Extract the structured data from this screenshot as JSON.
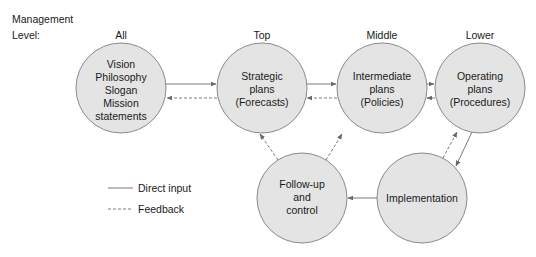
{
  "header": {
    "line1": "Management",
    "line2": "Level:"
  },
  "levels": [
    {
      "label": "All"
    },
    {
      "label": "Top"
    },
    {
      "label": "Middle"
    },
    {
      "label": "Lower"
    }
  ],
  "nodes": [
    {
      "id": "vision",
      "lines": [
        "Vision",
        "Philosophy",
        "Slogan",
        "Mission",
        "statements"
      ]
    },
    {
      "id": "strategic",
      "lines": [
        "Strategic",
        "plans",
        "(Forecasts)"
      ]
    },
    {
      "id": "intermediate",
      "lines": [
        "Intermediate",
        "plans",
        "(Policies)"
      ]
    },
    {
      "id": "operating",
      "lines": [
        "Operating",
        "plans",
        "(Procedures)"
      ]
    },
    {
      "id": "followup",
      "lines": [
        "Follow-up",
        "and",
        "control"
      ]
    },
    {
      "id": "implementation",
      "lines": [
        "Implementation"
      ]
    }
  ],
  "legend": {
    "direct": "Direct input",
    "feedback": "Feedback"
  },
  "colors": {
    "circle_fill": "#e4e4e4",
    "circle_stroke": "#8a8a8a",
    "line": "#7a7a7a"
  }
}
